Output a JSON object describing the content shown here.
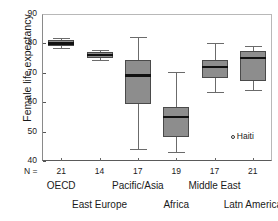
{
  "chart_data": {
    "type": "box",
    "title": "",
    "xlabel": "",
    "ylabel": "Female life expectancy",
    "ylim": [
      40,
      90
    ],
    "yticks": [
      40,
      50,
      60,
      70,
      80,
      90
    ],
    "grid": false,
    "legend": null,
    "n_prefix": "N =",
    "categories": [
      "OECD",
      "East Europe",
      "Pacific/Asia",
      "Africa",
      "Middle East",
      "Latn America"
    ],
    "counts": [
      21,
      14,
      17,
      19,
      17,
      21
    ],
    "boxes": [
      {
        "label": "OECD",
        "n": 21,
        "whisker_low": 78.3,
        "q1": 79.1,
        "median": 80.0,
        "q3": 81.2,
        "whisker_high": 82.0
      },
      {
        "label": "East Europe",
        "n": 14,
        "whisker_low": 74.2,
        "q1": 75.0,
        "median": 76.1,
        "q3": 77.0,
        "whisker_high": 77.8
      },
      {
        "label": "Pacific/Asia",
        "n": 17,
        "whisker_low": 44.0,
        "q1": 59.3,
        "median": 69.2,
        "q3": 74.2,
        "whisker_high": 82.2
      },
      {
        "label": "Africa",
        "n": 19,
        "whisker_low": 43.0,
        "q1": 48.2,
        "median": 55.0,
        "q3": 58.5,
        "whisker_high": 70.2
      },
      {
        "label": "Middle East",
        "n": 17,
        "whisker_low": 63.3,
        "q1": 68.2,
        "median": 72.0,
        "q3": 74.2,
        "whisker_high": 80.0
      },
      {
        "label": "Latn America",
        "n": 21,
        "whisker_low": 64.3,
        "q1": 67.3,
        "median": 75.2,
        "q3": 77.3,
        "whisker_high": 79.0
      }
    ],
    "outliers": [
      {
        "label": "Haiti",
        "category": "Latn America",
        "value": 48.0
      }
    ],
    "colors": {
      "box_fill": "#8d8d8d",
      "box_edge": "#4a4a4a",
      "median": "#111111",
      "whisker": "#6b6b6b",
      "axis": "#5a5a5a",
      "text": "#1a1a1a",
      "background": "#ffffff"
    }
  },
  "ytick_labels": [
    "90",
    "80",
    "70",
    "60",
    "50",
    "40"
  ],
  "axis": {
    "n_prefix": "N ="
  }
}
